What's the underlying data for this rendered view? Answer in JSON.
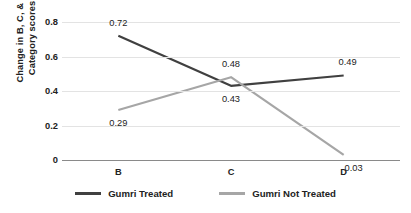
{
  "chart_data": {
    "type": "line",
    "title": "",
    "xlabel": "",
    "ylabel_line1": "Change in B, C, & D",
    "ylabel_line2": "Category scores",
    "categories": [
      "B",
      "C",
      "D"
    ],
    "ylim": [
      0,
      0.8
    ],
    "yticks": [
      "0",
      "0.2",
      "0.4",
      "0.6",
      "0.8"
    ],
    "ytick_values": [
      0,
      0.2,
      0.4,
      0.6,
      0.8
    ],
    "grid": true,
    "legend_position": "bottom",
    "series": [
      {
        "name": "Gumri Treated",
        "color": "#404040",
        "values": [
          0.72,
          0.43,
          0.49
        ],
        "labels": [
          "0.72",
          "0.43",
          "0.49"
        ]
      },
      {
        "name": "Gumri Not Treated",
        "color": "#a6a6a6",
        "values": [
          0.29,
          0.48,
          0.03
        ],
        "labels": [
          "0.29",
          "0.48",
          "0.03"
        ]
      }
    ]
  }
}
